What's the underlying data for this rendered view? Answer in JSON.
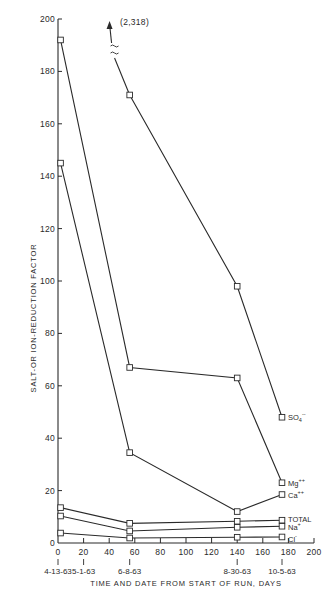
{
  "chart_data": {
    "type": "line",
    "title": "",
    "xlabel": "TIME AND DATE FROM START OF RUN, DAYS",
    "ylabel": "SALT-OR ION-REDUCTION FACTOR",
    "xlim": [
      0,
      200
    ],
    "ylim": [
      0,
      200
    ],
    "x_ticks": [
      0,
      20,
      40,
      60,
      80,
      100,
      120,
      140,
      160,
      180,
      200
    ],
    "y_ticks": [
      0,
      20,
      40,
      60,
      80,
      100,
      120,
      140,
      160,
      180,
      200
    ],
    "date_ticks": [
      {
        "x": 0,
        "label": "4-13-63"
      },
      {
        "x": 20,
        "label": "5-1-63"
      },
      {
        "x": 56,
        "label": "6-8-63"
      },
      {
        "x": 140,
        "label": "8-30-63"
      },
      {
        "x": 175,
        "label": "10-5-63"
      }
    ],
    "grid": false,
    "legend": "inline labels at right end of each series",
    "annotations": [
      {
        "text": "(2,318)",
        "note": "SO4 value at day 2 off-scale, indicated by arrow with axis break"
      }
    ],
    "x": [
      2,
      56,
      140,
      175
    ],
    "series": [
      {
        "name": "SO4--",
        "label": "SO",
        "sub": "4",
        "sup": "--",
        "values": [
          318,
          171,
          98,
          48
        ]
      },
      {
        "name": "Mg++",
        "label": "Mg",
        "sub": "",
        "sup": "++",
        "values": [
          192,
          67,
          63,
          23
        ]
      },
      {
        "name": "Ca++",
        "label": "Ca",
        "sub": "",
        "sup": "++",
        "values": [
          145,
          34.5,
          12,
          18.5
        ]
      },
      {
        "name": "TOTAL",
        "label": "TOTAL",
        "sub": "",
        "sup": "",
        "values": [
          13.5,
          7.5,
          8.3,
          8.7
        ]
      },
      {
        "name": "Na+",
        "label": "Na",
        "sub": "",
        "sup": "+",
        "values": [
          10.3,
          4.6,
          6.0,
          6.4
        ]
      },
      {
        "name": "Cl-",
        "label": "Cl",
        "sub": "",
        "sup": "-",
        "values": [
          3.8,
          1.9,
          2.2,
          2.3
        ]
      }
    ]
  },
  "labels": {
    "ylabel": "SALT-OR ION-REDUCTION FACTOR",
    "xlabel": "TIME AND DATE FROM START OF RUN, DAYS",
    "offscale": "(2,318)"
  }
}
